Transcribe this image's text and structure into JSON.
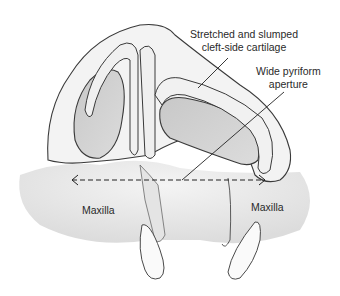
{
  "figure": {
    "type": "anatomical-illustration"
  },
  "labels": {
    "cartilage_line1": "Stretched and slumped",
    "cartilage_line2": "cleft-side cartilage",
    "aperture_line1": "Wide pyriform",
    "aperture_line2": "aperture",
    "maxilla_left": "Maxilla",
    "maxilla_right": "Maxilla"
  },
  "annotations": {
    "aperture_width_arrow": {
      "x1": 72,
      "x2": 265,
      "y": 180,
      "style": "dashed-double-arrow"
    }
  },
  "colors": {
    "outline": "#3a3a3a",
    "skin_fill": "#f2f2f2",
    "shadow_fill": "#d9d9d9",
    "nostril_fill": "#d0d0d0",
    "bone_fill": "#e8e8e8",
    "background": "#ffffff"
  }
}
